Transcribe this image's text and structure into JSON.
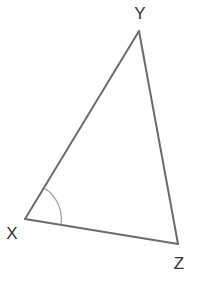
{
  "diagram": {
    "type": "triangle",
    "vertices": {
      "X": {
        "label": "X",
        "x": 25,
        "y": 219,
        "label_x": 12,
        "label_y": 239
      },
      "Y": {
        "label": "Y",
        "x": 139,
        "y": 31,
        "label_x": 140,
        "label_y": 19
      },
      "Z": {
        "label": "Z",
        "x": 178,
        "y": 244,
        "label_x": 179,
        "label_y": 269
      }
    },
    "sides": [
      "XY",
      "YZ",
      "XZ"
    ],
    "marked_angle": {
      "vertex": "X",
      "between": [
        "XY",
        "XZ"
      ],
      "style": "single-arc",
      "radius": 36
    },
    "colors": {
      "stroke": "#6b6b6b",
      "arc": "#9a9a9a",
      "label": "#333333",
      "background": "#ffffff"
    }
  }
}
